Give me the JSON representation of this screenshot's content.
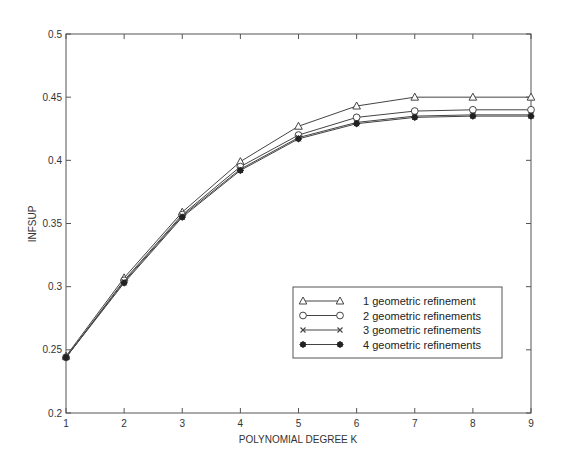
{
  "chart_data": {
    "type": "line",
    "title": "",
    "xlabel": "POLYNOMIAL DEGREE K",
    "ylabel": "INFSUP",
    "x": [
      1,
      2,
      3,
      4,
      5,
      6,
      7,
      8,
      9
    ],
    "xlim": [
      1,
      9
    ],
    "ylim": [
      0.2,
      0.5
    ],
    "xticks": [
      "1",
      "2",
      "3",
      "4",
      "5",
      "6",
      "7",
      "8",
      "9"
    ],
    "yticks": [
      "0.2",
      "0.25",
      "0.3",
      "0.35",
      "0.4",
      "0.45",
      "0.5"
    ],
    "grid": false,
    "legend_position": "lower right (inside)",
    "series": [
      {
        "name": "1 geometric refinement",
        "marker": "triangle",
        "values": [
          0.245,
          0.307,
          0.359,
          0.399,
          0.427,
          0.443,
          0.45,
          0.45,
          0.45
        ]
      },
      {
        "name": "2 geometric refinements",
        "marker": "circle",
        "values": [
          0.244,
          0.305,
          0.357,
          0.395,
          0.42,
          0.434,
          0.439,
          0.44,
          0.44
        ]
      },
      {
        "name": "3 geometric refinements",
        "marker": "x",
        "values": [
          0.244,
          0.304,
          0.356,
          0.393,
          0.418,
          0.43,
          0.435,
          0.436,
          0.436
        ]
      },
      {
        "name": "4 geometric refinements",
        "marker": "star",
        "values": [
          0.244,
          0.303,
          0.355,
          0.392,
          0.417,
          0.429,
          0.434,
          0.435,
          0.435
        ]
      }
    ]
  },
  "colors": {
    "line": "#444444",
    "axis": "#555555",
    "text": "#333333"
  }
}
